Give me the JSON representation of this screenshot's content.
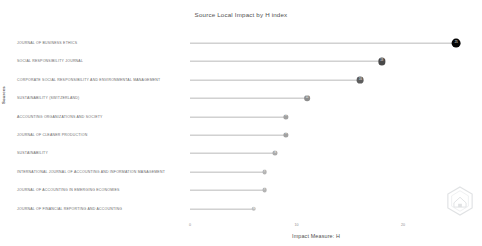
{
  "chart_data": {
    "type": "bar",
    "subtype": "lollipop-horizontal",
    "title": "Source Local Impact by H index",
    "xlabel": "Impact Measure: H",
    "ylabel": "Sources",
    "grid": false,
    "legend": null,
    "xlim": [
      0,
      26
    ],
    "xticks": [
      "0",
      "10",
      "20"
    ],
    "xtick_values": [
      0,
      10,
      20
    ],
    "categories": [
      "JOURNAL OF BUSINESS ETHICS",
      "SOCIAL RESPONSIBILITY JOURNAL",
      "CORPORATE SOCIAL RESPONSIBILITY AND ENVIRONMENTAL MANAGEMENT",
      "SUSTAINABILITY (SWITZERLAND)",
      "ACCOUNTING ORGANIZATIONS AND SOCIETY",
      "JOURNAL OF CLEANER PRODUCTION",
      "SUSTAINABILITY",
      "INTERNATIONAL JOURNAL OF ACCOUNTING AND INFORMATION MANAGEMENT",
      "JOURNAL OF ACCOUNTING IN EMERGING ECONOMIES",
      "JOURNAL OF FINANCIAL REPORTING AND ACCOUNTING"
    ],
    "values": [
      25,
      18,
      16,
      11,
      9,
      9,
      8,
      7,
      7,
      6
    ]
  },
  "watermark": {
    "name": "hexagon-logo-watermark"
  }
}
